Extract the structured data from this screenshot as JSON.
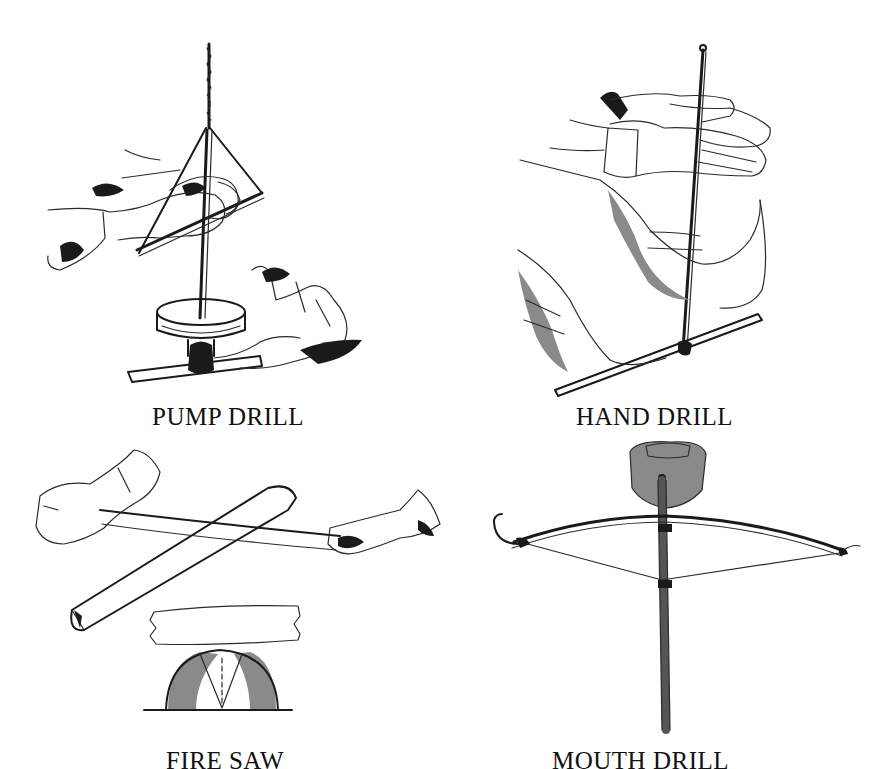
{
  "figure": {
    "panels": [
      {
        "id": "pump-drill",
        "label": "PUMP DRILL"
      },
      {
        "id": "hand-drill",
        "label": "HAND DRILL"
      },
      {
        "id": "fire-saw",
        "label": "FIRE SAW"
      },
      {
        "id": "mouth-drill",
        "label": "MOUTH DRILL"
      }
    ],
    "colors": {
      "background": "#ffffff",
      "ink": "#1a1a1a"
    }
  }
}
